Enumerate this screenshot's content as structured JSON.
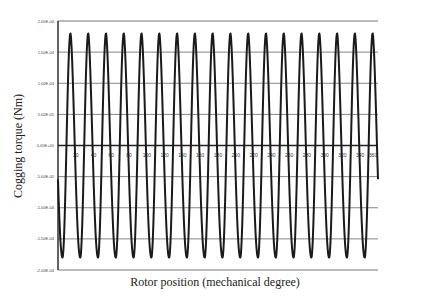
{
  "chart_data": {
    "type": "line",
    "title": "",
    "xlabel": "Rotor position (mechanical degree)",
    "ylabel": "Cogging torque (Nm)",
    "xlim": [
      0,
      360
    ],
    "ylim": [
      -0.0002,
      0.0002
    ],
    "grid": true,
    "legend": "none",
    "x_ticks": [
      20,
      40,
      60,
      80,
      100,
      120,
      140,
      160,
      180,
      200,
      220,
      240,
      260,
      280,
      300,
      320,
      340,
      360
    ],
    "x_tick_labels": [
      "20",
      "40",
      "60",
      "80",
      "100",
      "120",
      "140",
      "160",
      "180",
      "200",
      "220",
      "240",
      "260",
      "280",
      "300",
      "320",
      "340",
      "360"
    ],
    "y_ticks": [
      0.0002,
      0.00015,
      0.0001,
      5e-05,
      0,
      -5e-05,
      -0.0001,
      -0.00015,
      -0.0002
    ],
    "y_tick_labels": [
      "2.00E-04",
      "1.50E-04",
      "1.00E-04",
      "5.00E-05",
      "0.00E+00",
      "-5.00E-05",
      "-1.00E-04",
      "-1.50E-04",
      "-2.00E-04"
    ],
    "series": [
      {
        "name": "Cogging torque",
        "period_deg": 20,
        "cycles": 18,
        "peak": 0.00018,
        "trough": -0.00018,
        "peak_position_in_cycle_deg": 14,
        "trough_position_in_cycle_deg": 5,
        "color": "#1a1a1a"
      }
    ]
  }
}
